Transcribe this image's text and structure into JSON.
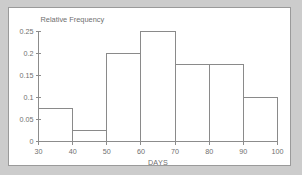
{
  "chart_data": {
    "type": "bar",
    "title": "",
    "subtitle": "",
    "xlabel": "DAYS",
    "ylabel": "Relative Frequency",
    "bin_edges": [
      30,
      40,
      50,
      60,
      70,
      80,
      90,
      100
    ],
    "categories": [
      "30-40",
      "40-50",
      "50-60",
      "60-70",
      "70-80",
      "80-90",
      "90-100"
    ],
    "values": [
      0.075,
      0.025,
      0.2,
      0.25,
      0.175,
      0.175,
      0.1
    ],
    "xlim": [
      30,
      100
    ],
    "ylim": [
      0,
      0.25
    ],
    "xticks": [
      30,
      40,
      50,
      60,
      70,
      80,
      90,
      100
    ],
    "xtick_labels": [
      "30",
      "40",
      "50",
      "60",
      "70",
      "80",
      "90",
      "100"
    ],
    "yticks": [
      0,
      0.05,
      0.1,
      0.15,
      0.2,
      0.25
    ],
    "ytick_labels": [
      "0",
      "0.05",
      "0.1",
      "0.15",
      "0.2",
      "0.25"
    ],
    "grid": false,
    "legend": null,
    "bar_fill": "none",
    "bar_stroke": "#8a8a8a",
    "axis_color": "#8c8c8c",
    "text_color": "#6f6f6f",
    "panel_background": "#ffffff",
    "page_background": "#cccccc"
  }
}
